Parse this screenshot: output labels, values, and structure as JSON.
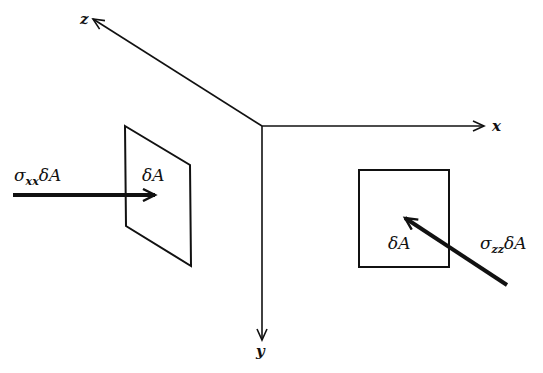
{
  "diagram": {
    "axes": {
      "x_label": "x",
      "y_label": "y",
      "z_label": "z"
    },
    "left_element": {
      "area_label": "δA",
      "force_symbol": "σ",
      "force_subscript": "xx",
      "force_suffix": "δA"
    },
    "right_element": {
      "area_label": "δA",
      "force_symbol": "σ",
      "force_subscript": "zz",
      "force_suffix": "δA"
    },
    "colors": {
      "stroke": "#111111",
      "background": "#ffffff"
    }
  }
}
